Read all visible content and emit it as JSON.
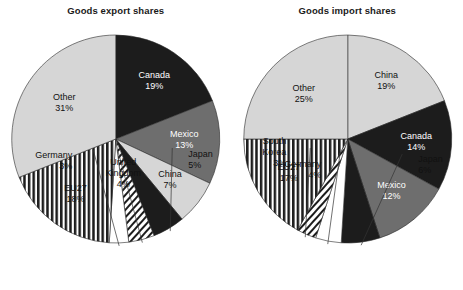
{
  "figure": {
    "background": "#ffffff",
    "width": 463,
    "height": 290
  },
  "palette": {
    "black": "#1c1c1c",
    "dark_gray": "#6e6e6e",
    "light_gray": "#d6d6d6",
    "white": "#ffffff",
    "outline": "#2a2a2a",
    "text": "#111111",
    "text_on_dark": "#ffffff"
  },
  "panels": [
    {
      "key": "export",
      "title": "Goods export shares"
    },
    {
      "key": "import",
      "title": "Goods import shares"
    }
  ],
  "chart_data": [
    {
      "type": "pie",
      "title": "Goods export shares",
      "xlabel": "",
      "ylabel": "",
      "units": "percent",
      "start_angle_deg": 0,
      "direction": "clockwise",
      "legend": "none",
      "grid": false,
      "categories": [
        "Canada",
        "Mexico",
        "China",
        "Japan",
        "United Kingdom",
        "Germany",
        "EU27",
        "Other"
      ],
      "values": [
        19,
        13,
        7,
        5,
        4,
        3,
        18,
        31
      ],
      "total": 100,
      "slices": [
        {
          "label": "Canada",
          "value": 19,
          "value_label": "19%",
          "fill": "#1c1c1c",
          "pattern": "solid",
          "label_placement": "inside",
          "label_color": "#ffffff"
        },
        {
          "label": "Mexico",
          "value": 13,
          "value_label": "13%",
          "fill": "#6e6e6e",
          "pattern": "solid",
          "label_placement": "inside",
          "label_color": "#ffffff"
        },
        {
          "label": "China",
          "value": 7,
          "value_label": "7%",
          "fill": "#d6d6d6",
          "pattern": "solid",
          "label_placement": "inside",
          "label_color": "#111111"
        },
        {
          "label": "Japan",
          "value": 5,
          "value_label": "5%",
          "fill": "#1c1c1c",
          "pattern": "solid",
          "label_placement": "outside",
          "label_color": "#111111"
        },
        {
          "label": "United Kingdom",
          "value": 4,
          "value_label": "4%",
          "fill": "#ffffff",
          "pattern": "diagonal",
          "label_placement": "outside",
          "label_color": "#111111"
        },
        {
          "label": "Germany",
          "value": 3,
          "value_label": "3%",
          "fill": "#ffffff",
          "pattern": "solid",
          "label_placement": "outside",
          "label_color": "#111111"
        },
        {
          "label": "EU27",
          "value": 18,
          "value_label": "18%",
          "fill": "#ffffff",
          "pattern": "vertical",
          "label_placement": "inside",
          "label_color": "#111111"
        },
        {
          "label": "Other",
          "value": 31,
          "value_label": "31%",
          "fill": "#d6d6d6",
          "pattern": "solid",
          "label_placement": "inside",
          "label_color": "#111111"
        }
      ]
    },
    {
      "type": "pie",
      "title": "Goods import shares",
      "xlabel": "",
      "ylabel": "",
      "units": "percent",
      "start_angle_deg": 0,
      "direction": "clockwise",
      "legend": "none",
      "grid": false,
      "categories": [
        "China",
        "Canada",
        "Mexico",
        "Japan",
        "Germany",
        "South Korea",
        "EU27",
        "Other"
      ],
      "values": [
        19,
        14,
        12,
        6,
        4,
        3,
        17,
        25
      ],
      "total": 100,
      "slices": [
        {
          "label": "China",
          "value": 19,
          "value_label": "19%",
          "fill": "#d6d6d6",
          "pattern": "solid",
          "label_placement": "inside",
          "label_color": "#111111"
        },
        {
          "label": "Canada",
          "value": 14,
          "value_label": "14%",
          "fill": "#1c1c1c",
          "pattern": "solid",
          "label_placement": "inside",
          "label_color": "#ffffff"
        },
        {
          "label": "Mexico",
          "value": 12,
          "value_label": "12%",
          "fill": "#6e6e6e",
          "pattern": "solid",
          "label_placement": "inside",
          "label_color": "#ffffff"
        },
        {
          "label": "Japan",
          "value": 6,
          "value_label": "6%",
          "fill": "#1c1c1c",
          "pattern": "solid",
          "label_placement": "outside",
          "label_color": "#111111"
        },
        {
          "label": "Germany",
          "value": 4,
          "value_label": "4%",
          "fill": "#ffffff",
          "pattern": "solid",
          "label_placement": "outside",
          "label_color": "#111111"
        },
        {
          "label": "South Korea",
          "value": 3,
          "value_label": "3%",
          "fill": "#ffffff",
          "pattern": "diagonal",
          "label_placement": "outside",
          "label_color": "#111111"
        },
        {
          "label": "EU27",
          "value": 17,
          "value_label": "17%",
          "fill": "#ffffff",
          "pattern": "vertical",
          "label_placement": "inside",
          "label_color": "#111111"
        },
        {
          "label": "Other",
          "value": 25,
          "value_label": "25%",
          "fill": "#d6d6d6",
          "pattern": "solid",
          "label_placement": "inside",
          "label_color": "#111111"
        }
      ]
    }
  ]
}
